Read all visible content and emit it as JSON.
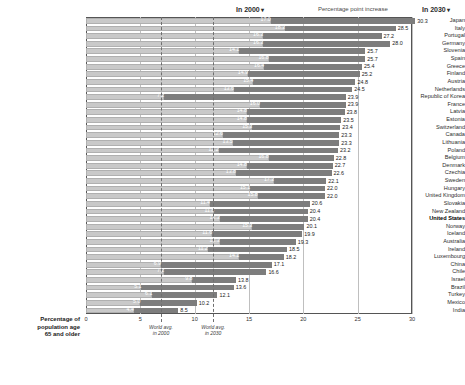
{
  "header": {
    "left_legend": "In 2000",
    "middle_legend": "Percentage point increase",
    "right_legend": "In 2030",
    "caret": "▾"
  },
  "axis": {
    "title": "Percentage of\npopulation age\n65 and older",
    "ticks": [
      "0",
      "5",
      "10",
      "15",
      "20",
      "25",
      "30"
    ],
    "xmin": 0,
    "xmax": 30
  },
  "reference_lines": [
    {
      "label": "World avg.\nin 2000",
      "value": 6.9
    },
    {
      "label": "World avg.\nin 2030",
      "value": 11.7
    }
  ],
  "chart_data": {
    "type": "bar",
    "orientation": "horizontal",
    "stacked": true,
    "title": "",
    "xlabel": "Percentage of population age 65 and older",
    "ylabel": "",
    "xlim": [
      0,
      30
    ],
    "grid": true,
    "legend_position": "top",
    "series": [
      {
        "name": "In 2000",
        "color": "#c9c9c9"
      },
      {
        "name": "Percentage point increase",
        "color": "#7d7d7d"
      }
    ],
    "categories": [
      "Japan",
      "Italy",
      "Portugal",
      "Germany",
      "Slovenia",
      "Spain",
      "Greece",
      "Finland",
      "Austria",
      "Netherlands",
      "Republic of Korea",
      "France",
      "Latvia",
      "Estonia",
      "Switzerland",
      "Canada",
      "Lithuania",
      "Poland",
      "Belgium",
      "Denmark",
      "Czechia",
      "Sweden",
      "Hungary",
      "United Kingdom",
      "Slovakia",
      "New Zealand",
      "United States",
      "Norway",
      "Iceland",
      "Australia",
      "Ireland",
      "Luxembourg",
      "China",
      "Chile",
      "Israel",
      "Brazil",
      "Turkey",
      "Mexico",
      "India"
    ],
    "rows": [
      {
        "country": "Japan",
        "v2000": 17.0,
        "v2030": 30.3,
        "highlight": false
      },
      {
        "country": "Italy",
        "v2000": 18.3,
        "v2030": 28.5,
        "highlight": false
      },
      {
        "country": "Portugal",
        "v2000": 16.3,
        "v2030": 27.2,
        "highlight": false
      },
      {
        "country": "Germany",
        "v2000": 16.3,
        "v2030": 28.0,
        "highlight": false
      },
      {
        "country": "Slovenia",
        "v2000": 14.1,
        "v2030": 25.7,
        "highlight": false
      },
      {
        "country": "Spain",
        "v2000": 16.8,
        "v2030": 25.7,
        "highlight": false
      },
      {
        "country": "Greece",
        "v2000": 16.4,
        "v2030": 25.4,
        "highlight": false
      },
      {
        "country": "Finland",
        "v2000": 14.9,
        "v2030": 25.2,
        "highlight": false
      },
      {
        "country": "Austria",
        "v2000": 15.4,
        "v2030": 24.8,
        "highlight": false
      },
      {
        "country": "Netherlands",
        "v2000": 13.6,
        "v2030": 24.5,
        "highlight": false
      },
      {
        "country": "Republic of Korea",
        "v2000": 7.2,
        "v2030": 23.9,
        "highlight": false
      },
      {
        "country": "France",
        "v2000": 16.0,
        "v2030": 23.9,
        "highlight": false
      },
      {
        "country": "Latvia",
        "v2000": 14.8,
        "v2030": 23.8,
        "highlight": false
      },
      {
        "country": "Estonia",
        "v2000": 14.8,
        "v2030": 23.5,
        "highlight": false
      },
      {
        "country": "Switzerland",
        "v2000": 15.3,
        "v2030": 23.4,
        "highlight": false
      },
      {
        "country": "Canada",
        "v2000": 12.6,
        "v2030": 23.3,
        "highlight": false
      },
      {
        "country": "Lithuania",
        "v2000": 13.5,
        "v2030": 23.3,
        "highlight": false
      },
      {
        "country": "Poland",
        "v2000": 12.2,
        "v2030": 23.2,
        "highlight": false
      },
      {
        "country": "Belgium",
        "v2000": 16.8,
        "v2030": 22.8,
        "highlight": false
      },
      {
        "country": "Denmark",
        "v2000": 14.8,
        "v2030": 22.7,
        "highlight": false
      },
      {
        "country": "Czechia",
        "v2000": 13.8,
        "v2030": 22.6,
        "highlight": false
      },
      {
        "country": "Sweden",
        "v2000": 17.3,
        "v2030": 22.1,
        "highlight": false
      },
      {
        "country": "Hungary",
        "v2000": 15.1,
        "v2030": 22.0,
        "highlight": false
      },
      {
        "country": "United Kingdom",
        "v2000": 15.8,
        "v2030": 22.0,
        "highlight": false
      },
      {
        "country": "Slovakia",
        "v2000": 11.4,
        "v2030": 20.6,
        "highlight": false
      },
      {
        "country": "New Zealand",
        "v2000": 11.8,
        "v2030": 20.4,
        "highlight": false
      },
      {
        "country": "United States",
        "v2000": 12.3,
        "v2030": 20.4,
        "highlight": true
      },
      {
        "country": "Norway",
        "v2000": 15.3,
        "v2030": 20.1,
        "highlight": false
      },
      {
        "country": "Iceland",
        "v2000": 11.6,
        "v2030": 19.9,
        "highlight": false
      },
      {
        "country": "Australia",
        "v2000": 12.3,
        "v2030": 19.3,
        "highlight": false
      },
      {
        "country": "Ireland",
        "v2000": 11.2,
        "v2030": 18.5,
        "highlight": false
      },
      {
        "country": "Luxembourg",
        "v2000": 14.1,
        "v2030": 18.2,
        "highlight": false
      },
      {
        "country": "China",
        "v2000": 6.9,
        "v2030": 17.1,
        "highlight": false
      },
      {
        "country": "Chile",
        "v2000": 7.2,
        "v2030": 16.6,
        "highlight": false
      },
      {
        "country": "Israel",
        "v2000": 9.8,
        "v2030": 13.8,
        "highlight": false
      },
      {
        "country": "Brazil",
        "v2000": 5.1,
        "v2030": 13.6,
        "highlight": false
      },
      {
        "country": "Turkey",
        "v2000": 6.1,
        "v2030": 12.1,
        "highlight": false
      },
      {
        "country": "Mexico",
        "v2000": 5.0,
        "v2030": 10.2,
        "highlight": false
      },
      {
        "country": "India",
        "v2000": 4.4,
        "v2030": 8.5,
        "highlight": false
      }
    ]
  }
}
